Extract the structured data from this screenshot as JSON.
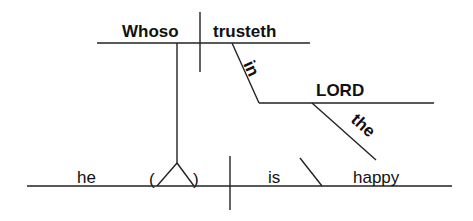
{
  "diagram": {
    "type": "sentence-diagram",
    "clause_subject": "Whoso",
    "clause_verb": "trusteth",
    "preposition": "in",
    "prep_object": "LORD",
    "article": "the",
    "main_subject": "he",
    "verb": "is",
    "predicate_adjective": "happy",
    "paren_open": "(",
    "paren_close": ")"
  }
}
